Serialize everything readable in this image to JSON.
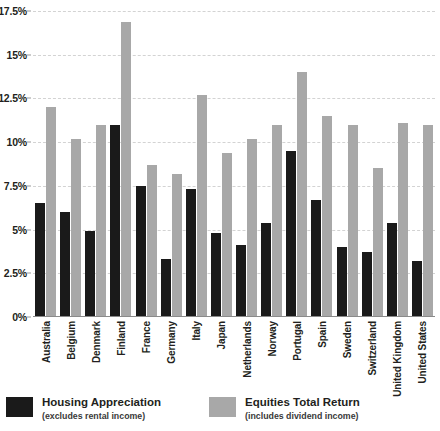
{
  "chart_data": {
    "type": "bar",
    "title": "",
    "xlabel": "",
    "ylabel": "",
    "ylim": [
      0,
      17.5
    ],
    "yticks": [
      0,
      2.5,
      5,
      7.5,
      10,
      12.5,
      15,
      17.5
    ],
    "ytick_labels": [
      "0%",
      "2.5%",
      "5%",
      "7.5%",
      "10%",
      "12.5%",
      "15%",
      "17.5%"
    ],
    "grid": true,
    "legend_position": "bottom-left",
    "categories": [
      "Australia",
      "Belgium",
      "Denmark",
      "Finland",
      "France",
      "Germany",
      "Italy",
      "Japan",
      "Netherlands",
      "Norway",
      "Portugal",
      "Spain",
      "Sweden",
      "Switzerland",
      "United Kingdom",
      "United States"
    ],
    "series": [
      {
        "name": "Housing Appreciation",
        "sublabel": "(excludes rental income)",
        "color": "#1a1a1a",
        "values": [
          6.5,
          6.0,
          4.9,
          11.0,
          7.5,
          3.3,
          7.3,
          4.8,
          4.1,
          5.4,
          9.5,
          6.7,
          4.0,
          3.7,
          5.4,
          3.2
        ]
      },
      {
        "name": "Equities Total Return",
        "sublabel": "(includes dividend income)",
        "color": "#a8a8a8",
        "values": [
          12.0,
          10.2,
          11.0,
          16.9,
          8.7,
          8.2,
          12.7,
          9.4,
          10.2,
          11.0,
          14.0,
          11.5,
          11.0,
          8.5,
          11.1,
          11.0
        ]
      }
    ]
  },
  "legend": {
    "items": [
      {
        "label": "Housing Appreciation",
        "sublabel": "(excludes rental income)"
      },
      {
        "label": "Equities Total Return",
        "sublabel": "(includes dividend income)"
      }
    ]
  }
}
